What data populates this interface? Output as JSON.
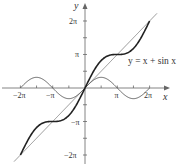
{
  "chart_data": {
    "type": "line",
    "title": "",
    "xlabel": "x",
    "ylabel": "y",
    "xlim": [
      -6.9,
      7.4
    ],
    "ylim": [
      -7.3,
      8.2
    ],
    "grid": false,
    "legend": "none",
    "x_ticks": [
      {
        "value": -6.2832,
        "label": "−2π"
      },
      {
        "value": -4.7124,
        "label": ""
      },
      {
        "value": -3.1416,
        "label": "−π"
      },
      {
        "value": -1.5708,
        "label": ""
      },
      {
        "value": 1.5708,
        "label": ""
      },
      {
        "value": 3.1416,
        "label": "π"
      },
      {
        "value": 4.7124,
        "label": ""
      },
      {
        "value": 6.2832,
        "label": "2π"
      }
    ],
    "y_ticks": [
      {
        "value": 6.2832,
        "label": "2π"
      },
      {
        "value": 4.7124,
        "label": ""
      },
      {
        "value": 3.1416,
        "label": "π"
      },
      {
        "value": 1.5708,
        "label": ""
      },
      {
        "value": -1.5708,
        "label": ""
      },
      {
        "value": -3.1416,
        "label": "−π"
      },
      {
        "value": -4.7124,
        "label": ""
      },
      {
        "value": -6.2832,
        "label": "−2π"
      }
    ],
    "series": [
      {
        "name": "y = x",
        "expr": "x",
        "domain": [
          -6.9,
          7.0
        ],
        "style": "thin",
        "color": "#7a7a7a"
      },
      {
        "name": "y = sin x",
        "expr": "sin(x)",
        "domain": [
          -6.2832,
          6.2832
        ],
        "style": "thin",
        "color": "#555555"
      },
      {
        "name": "y = x + sin x",
        "expr": "x + sin(x)",
        "domain": [
          -6.2832,
          6.2832
        ],
        "style": "thick",
        "color": "#222222"
      }
    ],
    "annotations": [
      {
        "text": "y = x + sin x",
        "x": 3.3,
        "y": 2.6
      }
    ]
  },
  "labels": {
    "x_axis": "x",
    "y_axis": "y",
    "curve": "y = x + sin x",
    "x_tick_neg2pi": "−2π",
    "x_tick_negpi": "−π",
    "x_tick_pi": "π",
    "x_tick_2pi": "2π",
    "y_tick_2pi": "2π",
    "y_tick_pi": "π",
    "y_tick_negpi": "−π",
    "y_tick_neg2pi": "−2π"
  },
  "colors": {
    "axis": "#666666",
    "curve_main": "#222222",
    "curve_line": "#7a7a7a",
    "curve_sine": "#555555"
  }
}
